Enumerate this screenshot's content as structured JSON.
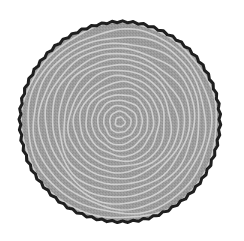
{
  "image": {
    "subject": "tree trunk cross-section",
    "caption": "Tree rings",
    "background": "#ffffff",
    "trunk": {
      "center": [
        120,
        122
      ],
      "radius": 100,
      "fill": "#9a9a9a",
      "bark_color": "#1e1e1e",
      "bark_width": 3
    },
    "rings": {
      "count": 17,
      "pith_center": [
        120,
        122
      ],
      "color": "#d6d6d6",
      "stroke_width": 1.6,
      "spacing": 5.8
    }
  }
}
